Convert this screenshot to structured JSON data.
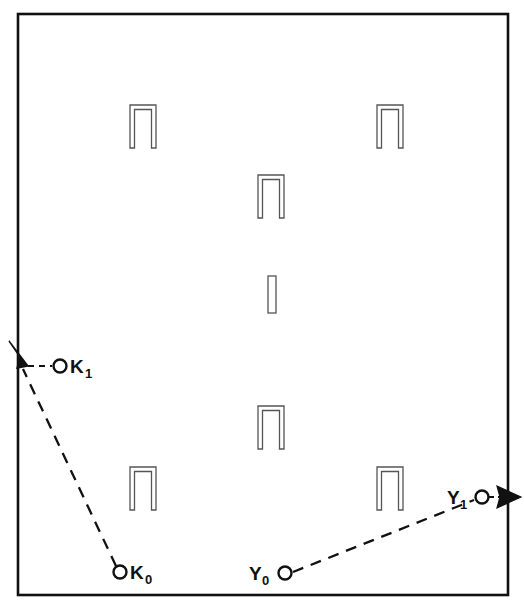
{
  "diagram": {
    "canvas": {
      "width": 524,
      "height": 608
    },
    "colors": {
      "ink": "#111111",
      "background": "#ffffff",
      "staple_outline": "#555555",
      "staple_fill": "#ffffff"
    },
    "border": {
      "name": "outer-frame",
      "x": 18,
      "y": 14,
      "width": 490,
      "height": 581,
      "stroke_width": 2.6
    },
    "staples": [
      {
        "id": "staple-top-left",
        "type": "open-staple",
        "cx": 143,
        "cy": 118,
        "width": 26,
        "height": 30
      },
      {
        "id": "staple-top-right",
        "type": "open-staple",
        "cx": 390,
        "cy": 118,
        "width": 26,
        "height": 30
      },
      {
        "id": "staple-upper-center",
        "type": "open-staple",
        "cx": 271,
        "cy": 188,
        "width": 26,
        "height": 30
      },
      {
        "id": "staple-center-bar",
        "type": "closed-bar",
        "cx": 272,
        "cy": 294,
        "width": 9,
        "height": 36
      },
      {
        "id": "staple-lower-center",
        "type": "open-staple",
        "cx": 271,
        "cy": 419,
        "width": 26,
        "height": 30
      },
      {
        "id": "staple-bottom-left",
        "type": "open-staple",
        "cx": 143,
        "cy": 480,
        "width": 26,
        "height": 30
      },
      {
        "id": "staple-bottom-right",
        "type": "open-staple",
        "cx": 390,
        "cy": 480,
        "width": 26,
        "height": 30
      }
    ],
    "vectors": [
      {
        "id": "k-vector",
        "from_point": "K_0",
        "to_point": "K_1",
        "style": "dashed",
        "arrow": "at-start-extension",
        "path": {
          "x1": 120,
          "y1": 572,
          "x2": 22,
          "y2": 365
        },
        "arrow_tip": {
          "x": 9,
          "y": 341
        }
      },
      {
        "id": "y-vector",
        "from_point": "Y_0",
        "to_point": "Y_1",
        "style": "dashed",
        "arrow": "at-end-extension",
        "path": {
          "x1": 288,
          "y1": 573,
          "x2": 478,
          "y2": 498
        },
        "arrow_tip": {
          "x": 521,
          "y": 497
        }
      }
    ],
    "points": [
      {
        "id": "point-k1",
        "label": "K",
        "subscript": "1",
        "circle": {
          "cx": 60,
          "cy": 366,
          "r": 6.5
        },
        "label_position": "right",
        "label_x": 70,
        "label_y": 373,
        "leader": {
          "x1": 27,
          "y1": 366,
          "x2": 53,
          "y2": 366,
          "style": "dashed"
        }
      },
      {
        "id": "point-k0",
        "label": "K",
        "subscript": "0",
        "circle": {
          "cx": 120,
          "cy": 572,
          "r": 6.5
        },
        "label_position": "right",
        "label_x": 130,
        "label_y": 579
      },
      {
        "id": "point-y0",
        "label": "Y",
        "subscript": "0",
        "circle": {
          "cx": 285,
          "cy": 573,
          "r": 6.5
        },
        "label_position": "left",
        "label_x": 249,
        "label_y": 580
      },
      {
        "id": "point-y1",
        "label": "Y",
        "subscript": "1",
        "circle": {
          "cx": 482,
          "cy": 497,
          "r": 6.5
        },
        "label_position": "left",
        "label_x": 447,
        "label_y": 504
      }
    ]
  }
}
